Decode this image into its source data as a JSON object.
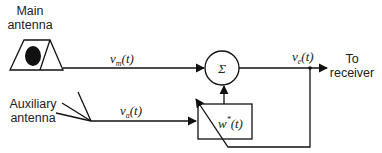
{
  "labels": {
    "main_antenna_line1": "Main",
    "main_antenna_line2": "antenna",
    "aux_antenna_line1": "Auxiliary",
    "aux_antenna_line2": "antenna",
    "to_receiver_line1": "To",
    "to_receiver_line2": "receiver"
  },
  "signals": {
    "vm": {
      "base": "v",
      "sub": "m",
      "arg": "(t)"
    },
    "va": {
      "base": "v",
      "sub": "a",
      "arg": "(t)"
    },
    "ve": {
      "base": "v",
      "sub": "e",
      "arg": "(t)"
    }
  },
  "blocks": {
    "summer": "Σ",
    "weight": {
      "base": "w",
      "sup": "*",
      "arg": "(t)"
    }
  },
  "colors": {
    "stroke": "#111111",
    "text": "#222222",
    "background": "#ffffff"
  }
}
